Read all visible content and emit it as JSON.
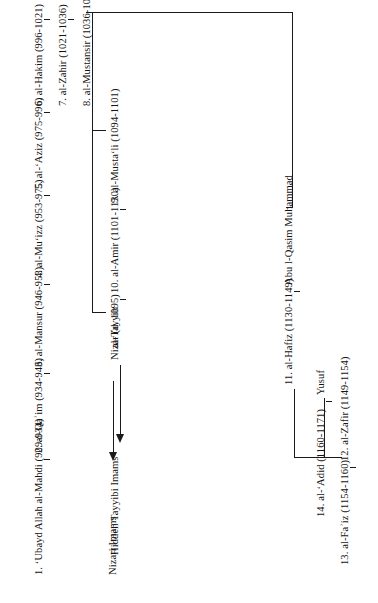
{
  "document": {
    "type": "genealogical-chart",
    "subject": "Fatimid Imam-Caliphs and the Nizari / Tayyibi succession",
    "orientation": "rotated-90-ccw"
  },
  "main_line": {
    "label": "Fatimid Imam-Caliphs",
    "imams": [
      {
        "n": "1.",
        "name": "ʻUbayd Allah al-Mahdi",
        "dates": "(909–934)",
        "full": "1. ʻUbayd Allah al-Mahdi (909-934)"
      },
      {
        "n": "2.",
        "name": "al-Qaʾim",
        "dates": "(934–946)",
        "full": "2. al-Qaʾim (934-946)"
      },
      {
        "n": "3.",
        "name": "al-Mansur",
        "dates": "(946–953)",
        "full": "3. al-Mansur (946-953)"
      },
      {
        "n": "4.",
        "name": "al-Muʻizz",
        "dates": "(953–975)",
        "full": "4. al-Muʻizz (953-975)"
      },
      {
        "n": "5.",
        "name": "al-ʻAziz",
        "dates": "(975–996)",
        "full": "5. al-ʻAziz (975-996)"
      },
      {
        "n": "6.",
        "name": "al-Hakim",
        "dates": "(996–1021)",
        "full": "6. al-Hakim (996-1021)"
      },
      {
        "n": "7.",
        "name": "al-Zahir",
        "dates": "(1021–1036)",
        "full": "7. al-Zahir (1021-1036)"
      },
      {
        "n": "8.",
        "name": "al-Mustansir",
        "dates": "(1036–1094)",
        "full": "8. al-Mustansir (1036-1094)"
      }
    ]
  },
  "nizari_branch": {
    "node": "Nizar (d. 1095)",
    "terminal": "Nizari Imams"
  },
  "mustali_branch": {
    "imams": [
      {
        "full": "9. al-Mustaʻli (1094-1101)"
      },
      {
        "full": "10. al-Amir (1101-1130)"
      },
      {
        "full": "al-Tayyib"
      }
    ],
    "terminal": "Hidden Tayyibi Imams"
  },
  "hafizi_branch": {
    "ancestor": "Abu l-Qasim Muhammad",
    "intermediate": "Yusuf",
    "imams": [
      {
        "full": "11. al-Hafiz (1130-1149)"
      },
      {
        "full": "12. al-Zafir (1149-1154)"
      },
      {
        "full": "13. al-Faʾiz (1154-1160)"
      },
      {
        "full": "14. al-ʻAdid (1160-1171)"
      }
    ]
  },
  "colors": {
    "ink": "#141414",
    "rule": "#1a1a1a",
    "paper": "#ffffff"
  }
}
